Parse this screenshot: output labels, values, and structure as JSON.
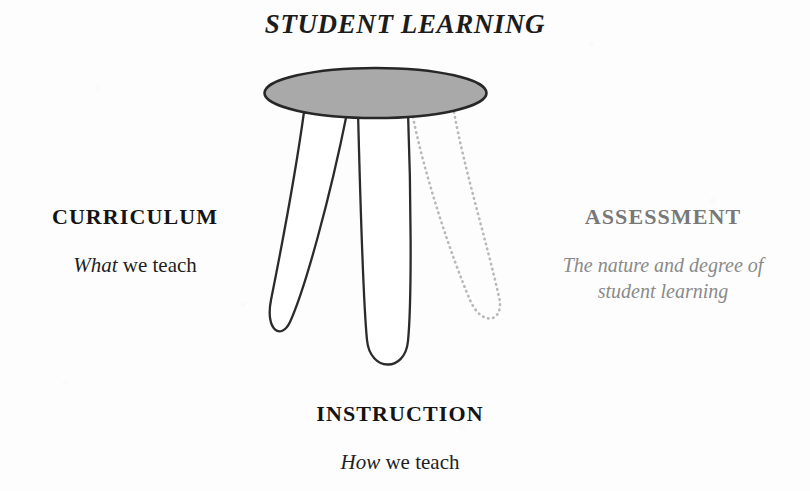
{
  "figure": {
    "title": "STUDENT LEARNING"
  },
  "labels": {
    "top": {
      "heading": "STUDENT LEARNING"
    },
    "left": {
      "heading": "CURRICULUM",
      "sub_emphasis": "What",
      "sub_rest": " we teach"
    },
    "right": {
      "heading": "ASSESSMENT",
      "sub": "The nature and degree of student learning"
    },
    "bottom": {
      "heading": "INSTRUCTION",
      "sub_emphasis": "How",
      "sub_rest": " we teach"
    }
  },
  "graphic": {
    "seat_name": "stool-seat-ellipse",
    "seat_fill": "#a9a9a9",
    "seat_stroke": "#272727",
    "leg_stroke": "#2b2b2b",
    "dotted_leg_stroke": "#b4b4b4",
    "legs": [
      {
        "name": "stool-leg-curriculum",
        "style": "solid"
      },
      {
        "name": "stool-leg-instruction",
        "style": "solid"
      },
      {
        "name": "stool-leg-assessment",
        "style": "dotted"
      }
    ]
  }
}
